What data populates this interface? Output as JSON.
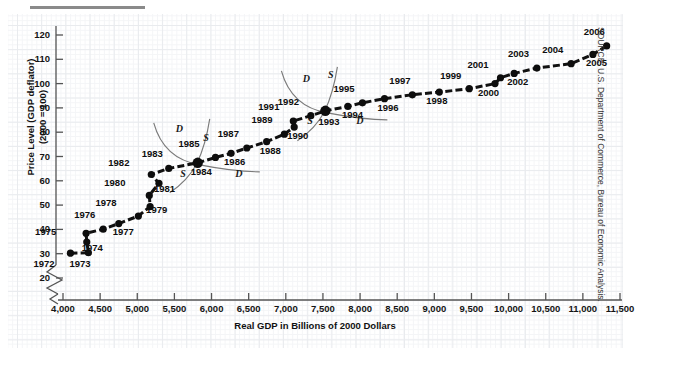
{
  "figure": {
    "source_note": "SOURCE: U.S. Department of Commerce, Bureau of Economic Analysis."
  },
  "chart_data": {
    "type": "scatter",
    "title": "",
    "xlabel": "Real GDP in Billions of 2000 Dollars",
    "ylabel": "Price Level (GDP deflator)\n(2000 = 100)",
    "ylabel_line1": "Price Level (GDP deflator)",
    "ylabel_line2": "(2000 = 100)",
    "grid": true,
    "legend": "none",
    "xlim": [
      3800,
      11600
    ],
    "ylim": [
      18,
      124
    ],
    "x_axis_break": true,
    "xticks": [
      4000,
      4500,
      5000,
      5500,
      6000,
      6500,
      7000,
      7500,
      8000,
      8500,
      9000,
      9500,
      10000,
      10500,
      11000,
      11500
    ],
    "xtick_labels": [
      "4,000",
      "4,500",
      "5,000",
      "5,500",
      "6,000",
      "6,500",
      "7,000",
      "7,500",
      "8,000",
      "8,500",
      "9,000",
      "9,500",
      "10,000",
      "10,500",
      "11,000",
      "11,500"
    ],
    "yticks": [
      20,
      30,
      40,
      50,
      60,
      70,
      80,
      90,
      100,
      110,
      120
    ],
    "ytick_labels": [
      "20",
      "30",
      "40",
      "50",
      "60",
      "70",
      "80",
      "90",
      "100",
      "110",
      "120"
    ],
    "series": [
      {
        "name": "U.S. Real GDP vs Price Level, 1972-2006",
        "connected": true,
        "points": [
          {
            "label": "1972",
            "x": 4100,
            "y": 30.2,
            "lx": -26,
            "ly": 11
          },
          {
            "label": "1973",
            "x": 4342,
            "y": 30.4,
            "lx": -8,
            "ly": 11
          },
          {
            "label": "1974",
            "x": 4320,
            "y": 34.8,
            "lx": 6,
            "ly": 6
          },
          {
            "label": "1975",
            "x": 4311,
            "y": 38.4,
            "lx": -40,
            "ly": -1
          },
          {
            "label": "1976",
            "x": 4541,
            "y": 40.1,
            "lx": -18,
            "ly": -14
          },
          {
            "label": "1977",
            "x": 4751,
            "y": 42.4,
            "lx": 5,
            "ly": 8
          },
          {
            "label": "1978",
            "x": 5015,
            "y": 45.5,
            "lx": -32,
            "ly": -13
          },
          {
            "label": "1979",
            "x": 5173,
            "y": 49.4,
            "lx": 7,
            "ly": 3
          },
          {
            "label": "1980",
            "x": 5162,
            "y": 54.0,
            "lx": -34,
            "ly": -12
          },
          {
            "label": "1981",
            "x": 5292,
            "y": 59.0,
            "lx": 6,
            "ly": 6
          },
          {
            "label": "1982",
            "x": 5189,
            "y": 62.6,
            "lx": -32,
            "ly": -11
          },
          {
            "label": "1983",
            "x": 5424,
            "y": 65.1,
            "lx": -16,
            "ly": -14
          },
          {
            "label": "1984",
            "x": 5814,
            "y": 67.4,
            "lx": 4,
            "ly": 9
          },
          {
            "label": "1985",
            "x": 6053,
            "y": 69.6,
            "lx": -26,
            "ly": -13
          },
          {
            "label": "1986",
            "x": 6263,
            "y": 71.3,
            "lx": 4,
            "ly": 9
          },
          {
            "label": "1987",
            "x": 6475,
            "y": 73.5,
            "lx": -18,
            "ly": -14
          },
          {
            "label": "1988",
            "x": 6742,
            "y": 76.1,
            "lx": 4,
            "ly": 9
          },
          {
            "label": "1989",
            "x": 6981,
            "y": 79.2,
            "lx": -22,
            "ly": -14
          },
          {
            "label": "1990",
            "x": 7113,
            "y": 82.1,
            "lx": 4,
            "ly": 9
          },
          {
            "label": "1991",
            "x": 7101,
            "y": 84.6,
            "lx": -24,
            "ly": -14
          },
          {
            "label": "1992",
            "x": 7337,
            "y": 86.8,
            "lx": -22,
            "ly": -14
          },
          {
            "label": "1993",
            "x": 7533,
            "y": 88.8,
            "lx": 4,
            "ly": 11
          },
          {
            "label": "1994",
            "x": 7836,
            "y": 90.6,
            "lx": 5,
            "ly": 9
          },
          {
            "label": "1995",
            "x": 8032,
            "y": 92.1,
            "lx": -18,
            "ly": -14
          },
          {
            "label": "1996",
            "x": 8329,
            "y": 93.8,
            "lx": 4,
            "ly": 9
          },
          {
            "label": "1997",
            "x": 8704,
            "y": 95.4,
            "lx": -12,
            "ly": -14
          },
          {
            "label": "1998",
            "x": 9067,
            "y": 96.5,
            "lx": -2,
            "ly": 9
          },
          {
            "label": "1999",
            "x": 9470,
            "y": 97.9,
            "lx": -18,
            "ly": -13
          },
          {
            "label": "2000",
            "x": 9817,
            "y": 100.0,
            "lx": -6,
            "ly": 9
          },
          {
            "label": "2001",
            "x": 9891,
            "y": 102.4,
            "lx": -22,
            "ly": -13
          },
          {
            "label": "2002",
            "x": 10075,
            "y": 104.2,
            "lx": 4,
            "ly": 9
          },
          {
            "label": "2003",
            "x": 10381,
            "y": 106.4,
            "lx": -18,
            "ly": -14
          },
          {
            "label": "2004",
            "x": 10842,
            "y": 108.2,
            "lx": -18,
            "ly": -14
          },
          {
            "label": "2005",
            "x": 11135,
            "y": 112.0,
            "lx": 4,
            "ly": 9
          },
          {
            "label": "2006",
            "x": 11320,
            "y": 115.5,
            "lx": -12,
            "ly": -14
          }
        ]
      }
    ],
    "annotations": [
      {
        "kind": "curve-label",
        "text": "D",
        "at_year": "1984",
        "x": 5560,
        "y": 81.0,
        "role": "demand-curve-1984"
      },
      {
        "kind": "curve-label",
        "text": "S",
        "at_year": "1984",
        "x": 5930,
        "y": 77.0,
        "role": "supply-curve-1984"
      },
      {
        "kind": "curve-label",
        "text": "S",
        "at_year": "1984",
        "x": 5620,
        "y": 62.5,
        "role": "supply-curve-1984-lower"
      },
      {
        "kind": "curve-label",
        "text": "D",
        "at_year": "1984",
        "x": 6360,
        "y": 62.5,
        "role": "demand-curve-1984-lower"
      },
      {
        "kind": "curve-label",
        "text": "D",
        "at_year": "1993",
        "x": 7270,
        "y": 101.5,
        "role": "demand-curve-1993"
      },
      {
        "kind": "curve-label",
        "text": "S",
        "at_year": "1993",
        "x": 7610,
        "y": 103.0,
        "role": "supply-curve-1993"
      },
      {
        "kind": "curve-label",
        "text": "S",
        "at_year": "1993",
        "x": 7330,
        "y": 84.3,
        "role": "supply-curve-1993-lower"
      },
      {
        "kind": "curve-label",
        "text": "D",
        "at_year": "1993",
        "x": 7990,
        "y": 84.3,
        "role": "demand-curve-1993-lower"
      }
    ],
    "equilibria": [
      "1984",
      "1993"
    ]
  }
}
